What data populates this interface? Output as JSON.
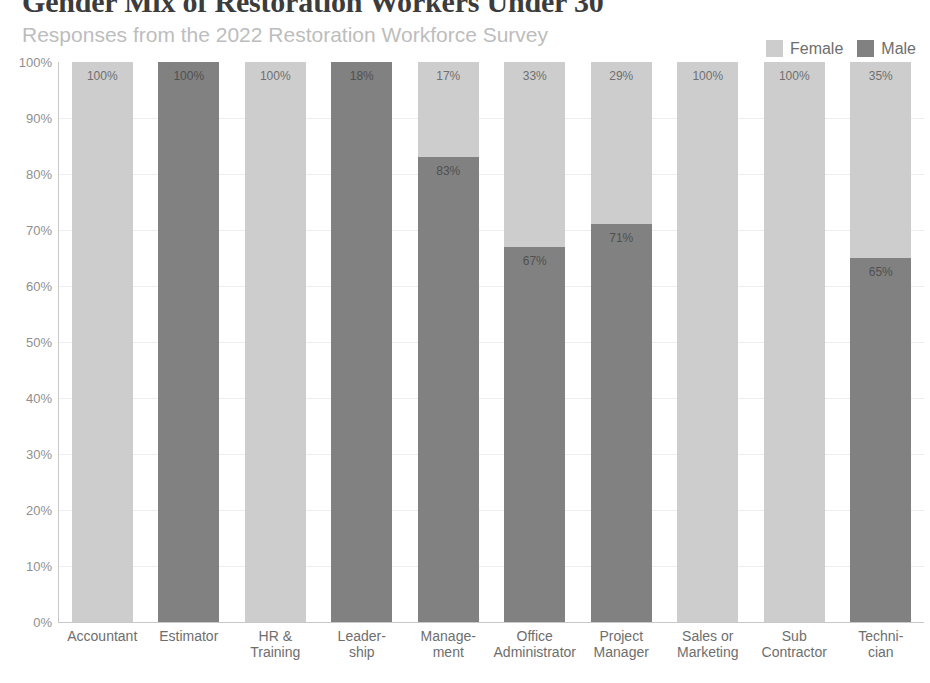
{
  "header": {
    "title": "Gender Mix of Restoration Workers Under 30",
    "subtitle": "Responses from the 2022 Restoration Workforce Survey"
  },
  "legend": {
    "position": "top-right",
    "items": [
      {
        "label": "Female",
        "color": "#cdcdcd",
        "swatch_name": "legend-swatch-female"
      },
      {
        "label": "Male",
        "color": "#818181",
        "swatch_name": "legend-swatch-male"
      }
    ]
  },
  "colors": {
    "female": "#cdcdcd",
    "male": "#818181",
    "axis": "#c8c8c8",
    "gridline": "#ededed",
    "title_text": "#3c3c3c",
    "subtitle_text": "#bdbdbd",
    "tick_text": "#6e6e6e"
  },
  "axes": {
    "y_ticks": [
      "100%",
      "90%",
      "80%",
      "70%",
      "60%",
      "50%",
      "40%",
      "30%",
      "20%",
      "10%",
      "0%"
    ],
    "y_tick_values": [
      100,
      90,
      80,
      70,
      60,
      50,
      40,
      30,
      20,
      10,
      0
    ],
    "x_labels": [
      "Accountant",
      "Estimator",
      "HR &\nTraining",
      "Leader-\nship",
      "Manage-\nment",
      "Office\nAdministrator",
      "Project\nManager",
      "Sales or\nMarketing",
      "Sub\nContractor",
      "Techni-\ncian"
    ]
  },
  "chart_data": {
    "type": "bar",
    "stacked": true,
    "stack_total": 100,
    "title": "Gender Mix of Restoration Workers Under 30",
    "subtitle": "Responses from the 2022 Restoration Workforce Survey",
    "xlabel": "",
    "ylabel": "",
    "ylim": [
      0,
      100
    ],
    "y_unit": "%",
    "grid": true,
    "legend_position": "top-right",
    "categories": [
      "Accountant",
      "Estimator",
      "HR & Training",
      "Leadership",
      "Management",
      "Office Administrator",
      "Project Manager",
      "Sales or Marketing",
      "Sub Contractor",
      "Technician"
    ],
    "series": [
      {
        "name": "Female",
        "color": "#cdcdcd",
        "values": [
          100,
          0,
          100,
          0,
          17,
          33,
          29,
          100,
          100,
          35
        ]
      },
      {
        "name": "Male",
        "color": "#818181",
        "values": [
          0,
          100,
          0,
          100,
          83,
          67,
          71,
          0,
          0,
          65
        ]
      }
    ],
    "bars": [
      {
        "category": "Accountant",
        "segments": [
          {
            "series": "Female",
            "value": 100,
            "label": "100%",
            "show_label": true
          },
          {
            "series": "Male",
            "value": 0,
            "label": "",
            "show_label": false
          }
        ]
      },
      {
        "category": "Estimator",
        "segments": [
          {
            "series": "Female",
            "value": 0,
            "label": "",
            "show_label": false
          },
          {
            "series": "Male",
            "value": 100,
            "label": "100%",
            "show_label": true
          }
        ]
      },
      {
        "category": "HR & Training",
        "segments": [
          {
            "series": "Female",
            "value": 100,
            "label": "100%",
            "show_label": true
          },
          {
            "series": "Male",
            "value": 0,
            "label": "",
            "show_label": false
          }
        ]
      },
      {
        "category": "Leadership",
        "segments": [
          {
            "series": "Female",
            "value": 0,
            "label": "",
            "show_label": false
          },
          {
            "series": "Male",
            "value": 100,
            "label": "18%",
            "show_label": true
          }
        ]
      },
      {
        "category": "Management",
        "segments": [
          {
            "series": "Female",
            "value": 17,
            "label": "17%",
            "show_label": true
          },
          {
            "series": "Male",
            "value": 83,
            "label": "83%",
            "show_label": true
          }
        ]
      },
      {
        "category": "Office Administrator",
        "segments": [
          {
            "series": "Female",
            "value": 33,
            "label": "33%",
            "show_label": true
          },
          {
            "series": "Male",
            "value": 67,
            "label": "67%",
            "show_label": true
          }
        ]
      },
      {
        "category": "Project Manager",
        "segments": [
          {
            "series": "Female",
            "value": 29,
            "label": "29%",
            "show_label": true
          },
          {
            "series": "Male",
            "value": 71,
            "label": "71%",
            "show_label": true
          }
        ]
      },
      {
        "category": "Sales or Marketing",
        "segments": [
          {
            "series": "Female",
            "value": 100,
            "label": "100%",
            "show_label": true
          },
          {
            "series": "Male",
            "value": 0,
            "label": "",
            "show_label": false
          }
        ]
      },
      {
        "category": "Sub Contractor",
        "segments": [
          {
            "series": "Female",
            "value": 100,
            "label": "100%",
            "show_label": true
          },
          {
            "series": "Male",
            "value": 0,
            "label": "",
            "show_label": false
          }
        ]
      },
      {
        "category": "Technician",
        "segments": [
          {
            "series": "Female",
            "value": 35,
            "label": "35%",
            "show_label": true
          },
          {
            "series": "Male",
            "value": 65,
            "label": "65%",
            "show_label": true
          }
        ]
      }
    ]
  }
}
